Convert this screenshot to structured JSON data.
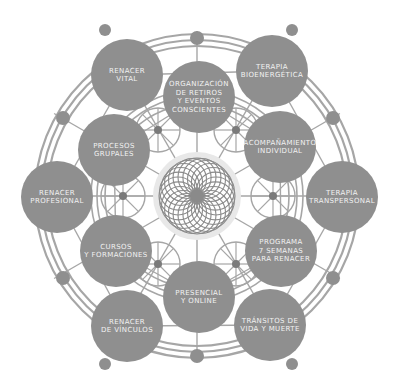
{
  "title": "",
  "center": {
    "icon": "spirograph-mandala-icon",
    "x": 197,
    "y": 196,
    "r": 38
  },
  "colors": {
    "node": "#8f8f8f",
    "line": "#a6a6a6",
    "text": "#f2f2f2",
    "background": "#ffffff",
    "mandala_glow": "#e8e8e8"
  },
  "outer_nodes": [
    {
      "id": "renacer-vital",
      "label": "RENACER\nVITAL",
      "x": 127,
      "y": 75,
      "r": 36
    },
    {
      "id": "terapia-bioenergetica",
      "label": "TERAPIA\nBIOENERGÉTICA",
      "x": 272,
      "y": 71,
      "r": 36
    },
    {
      "id": "terapia-transpersonal",
      "label": "TERAPIA\nTRANSPERSONAL",
      "x": 342,
      "y": 197,
      "r": 36
    },
    {
      "id": "transitos-de-vida-y-muerte",
      "label": "TRÁNSITOS DE\nVIDA Y MUERTE",
      "x": 270,
      "y": 325,
      "r": 36
    },
    {
      "id": "renacer-de-vinculos",
      "label": "RENACER\nDE VÍNCULOS",
      "x": 127,
      "y": 326,
      "r": 36
    },
    {
      "id": "renacer-profesional",
      "label": "RENACER\nPROFESIONAL",
      "x": 57,
      "y": 197,
      "r": 36
    }
  ],
  "inner_nodes": [
    {
      "id": "organizacion-de-retiros",
      "label": "ORGANIZACIÓN\nDE RETIROS\nY EVENTOS\nCONSCIENTES",
      "x": 199,
      "y": 97,
      "r": 36
    },
    {
      "id": "acompanamiento-individual",
      "label": "ACOMPAÑAMIENTO\nINDIVIDUAL",
      "x": 280,
      "y": 147,
      "r": 36
    },
    {
      "id": "programa-7-semanas",
      "label": "PROGRAMA\n7 SEMANAS\nPARA RENACER",
      "x": 281,
      "y": 251,
      "r": 36
    },
    {
      "id": "presencial-y-online",
      "label": "PRESENCIAL\nY ONLINE",
      "x": 199,
      "y": 297,
      "r": 36
    },
    {
      "id": "cursos-y-formaciones",
      "label": "CURSOS\nY FORMACIONES",
      "x": 116,
      "y": 251,
      "r": 36
    },
    {
      "id": "procesos-grupales",
      "label": "PROCESOS\nGRUPALES",
      "x": 114,
      "y": 150,
      "r": 36
    }
  ],
  "small_dots": [
    {
      "x": 105,
      "y": 30,
      "r": 6
    },
    {
      "x": 292,
      "y": 30,
      "r": 6
    },
    {
      "x": 197,
      "y": 38,
      "r": 7
    },
    {
      "x": 63,
      "y": 118,
      "r": 7
    },
    {
      "x": 333,
      "y": 118,
      "r": 7
    },
    {
      "x": 63,
      "y": 278,
      "r": 7
    },
    {
      "x": 333,
      "y": 278,
      "r": 7
    },
    {
      "x": 197,
      "y": 356,
      "r": 7
    },
    {
      "x": 105,
      "y": 364,
      "r": 6
    },
    {
      "x": 292,
      "y": 364,
      "r": 6
    },
    {
      "x": 158,
      "y": 130,
      "r": 4
    },
    {
      "x": 236,
      "y": 130,
      "r": 4
    },
    {
      "x": 123,
      "y": 196,
      "r": 4
    },
    {
      "x": 273,
      "y": 196,
      "r": 4
    },
    {
      "x": 158,
      "y": 264,
      "r": 4
    },
    {
      "x": 236,
      "y": 264,
      "r": 4
    }
  ],
  "rings": [
    {
      "r": 150
    },
    {
      "r": 156
    },
    {
      "r": 162
    }
  ]
}
